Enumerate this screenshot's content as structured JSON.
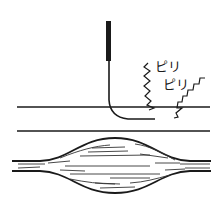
{
  "diagram": {
    "labels": [
      {
        "text": "ピリ",
        "x": 155,
        "y": 66
      },
      {
        "text": "ピリ",
        "x": 163,
        "y": 84
      }
    ],
    "elements": {
      "needle": "needle-icon",
      "skin_surface_line": "skin-surface",
      "subcutaneous_line": "tissue-boundary",
      "muscle": "muscle-fiber-bundle",
      "zigzags": [
        "tingle-zigzag-1",
        "tingle-zigzag-2"
      ]
    },
    "colors": {
      "stroke": "#1a1a1a",
      "background": "#ffffff"
    }
  }
}
